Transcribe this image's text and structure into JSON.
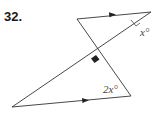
{
  "problem": {
    "number": "32."
  },
  "diagram": {
    "type": "geometry",
    "labels": {
      "top_angle": "x°",
      "bottom_angle": "2x°"
    },
    "markers": {
      "parallel_arrows": 2,
      "right_angle": true
    },
    "colors": {
      "line": "#333333",
      "right_angle_fill": "#222222",
      "label": "#444444"
    }
  }
}
